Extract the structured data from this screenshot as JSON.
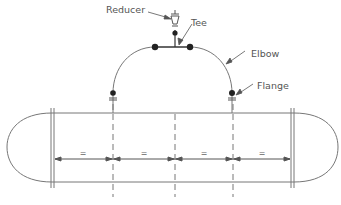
{
  "diagram": {
    "colors": {
      "line": "#777777",
      "dot": "#222222",
      "text": "#555555",
      "background": "#ffffff"
    },
    "labels": {
      "reducer": "Reducer",
      "tee": "Tee",
      "elbow": "Elbow",
      "flange": "Flange"
    },
    "dimensions": {
      "segments": [
        "=",
        "=",
        "=",
        "="
      ],
      "note": "equal spacing between nozzle centerlines"
    },
    "components": [
      {
        "id": "reducer",
        "type": "reducer",
        "x": 175,
        "y": 20
      },
      {
        "id": "tee",
        "type": "tee",
        "x": 175,
        "y": 47
      },
      {
        "id": "elbow-left",
        "type": "elbow",
        "x": 113,
        "y": 90
      },
      {
        "id": "elbow-right",
        "type": "elbow",
        "x": 232,
        "y": 90
      },
      {
        "id": "flange-left",
        "type": "flange",
        "x": 113,
        "y": 100
      },
      {
        "id": "flange-right",
        "type": "flange",
        "x": 232,
        "y": 100
      }
    ],
    "vessel": {
      "type": "horizontal vessel with elliptical heads",
      "centerlines_x": [
        113,
        175,
        233
      ]
    }
  }
}
